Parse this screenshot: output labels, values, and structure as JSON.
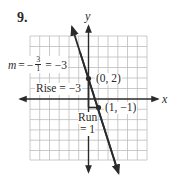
{
  "problem": {
    "number": "9."
  },
  "axes": {
    "x_label": "x",
    "y_label": "y"
  },
  "points": [
    {
      "label": "(0, 2)",
      "x": 0,
      "y": 2
    },
    {
      "label": "(1, −1)",
      "x": 1,
      "y": -1
    }
  ],
  "annotations": {
    "slope_m": "m",
    "slope_eq": "=",
    "slope_minus": "−",
    "slope_num": "3",
    "slope_den": "1",
    "slope_result": "= −3",
    "rise": "Rise = −3",
    "run_line1": "Run",
    "run_line2": "= 1"
  },
  "line": {
    "equation": "y = -3x + 2",
    "slope": -3,
    "intercept": 2
  },
  "grid": {
    "x_range": [
      -6,
      6
    ],
    "y_range": [
      -6,
      6
    ],
    "cell": 1
  },
  "colors": {
    "grid": "#b8b8b8",
    "ink": "#2a2a2a",
    "background": "#ffffff"
  }
}
